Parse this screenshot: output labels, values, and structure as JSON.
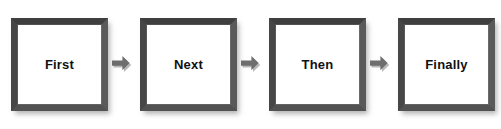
{
  "diagram": {
    "type": "process-flow",
    "orientation": "horizontal",
    "title": "",
    "background_color": "#ffffff",
    "box": {
      "fill_color": "#ffffff",
      "border_color": "#4a4a4a",
      "border_width_px": 7,
      "shadow_color": "#9a9a9a",
      "text_color": "#111111"
    },
    "connector": {
      "icon": "right-arrow-icon",
      "fill_color": "#6e6e6e",
      "shadow_color": "#b5b5b5",
      "count": 3
    },
    "steps": [
      {
        "label": "First"
      },
      {
        "label": "Next"
      },
      {
        "label": "Then"
      },
      {
        "label": "Finally"
      }
    ]
  }
}
